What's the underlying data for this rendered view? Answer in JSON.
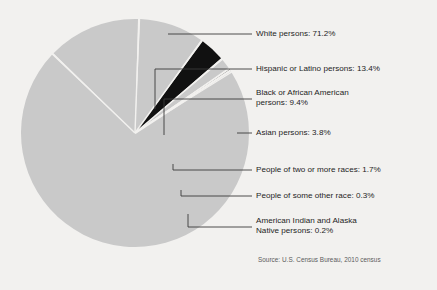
{
  "chart_data": {
    "type": "pie",
    "title": "",
    "source": "Source: U.S. Census Bureau, 2010 census",
    "unit": "%",
    "legend_position": "right-callouts",
    "categories": [
      "White persons",
      "Hispanic or Latino persons",
      "Black or African American persons",
      "Asian persons",
      "People of two or more races",
      "People of some other race",
      "American Indian and Alaska Native persons"
    ],
    "values": [
      71.2,
      13.4,
      9.4,
      3.8,
      1.7,
      0.3,
      0.2
    ],
    "colors": [
      "#c9c9c9",
      "#c9c9c9",
      "#c9c9c9",
      "#111111",
      "#c9c9c9",
      "#111111",
      "#c9c9c9"
    ],
    "slice_separator_color": "#f2f1ef",
    "labels": [
      {
        "line1": "White persons: 71.2%",
        "line2": "",
        "value": 71.2,
        "category": "White persons"
      },
      {
        "line1": "Hispanic or Latino persons: 13.4%",
        "line2": "",
        "value": 13.4,
        "category": "Hispanic or Latino persons"
      },
      {
        "line1": "Black or African American",
        "line2": "persons: 9.4%",
        "value": 9.4,
        "category": "Black or African American persons"
      },
      {
        "line1": "Asian persons: 3.8%",
        "line2": "",
        "value": 3.8,
        "category": "Asian persons"
      },
      {
        "line1": "People of two or more races: 1.7%",
        "line2": "",
        "value": 1.7,
        "category": "People of two or more races"
      },
      {
        "line1": "People of some other race: 0.3%",
        "line2": "",
        "value": 0.3,
        "category": "People of some other race"
      },
      {
        "line1": "American Indian and Alaska",
        "line2": "Native persons: 0.2%",
        "value": 0.2,
        "category": "American Indian and Alaska Native persons"
      }
    ]
  }
}
